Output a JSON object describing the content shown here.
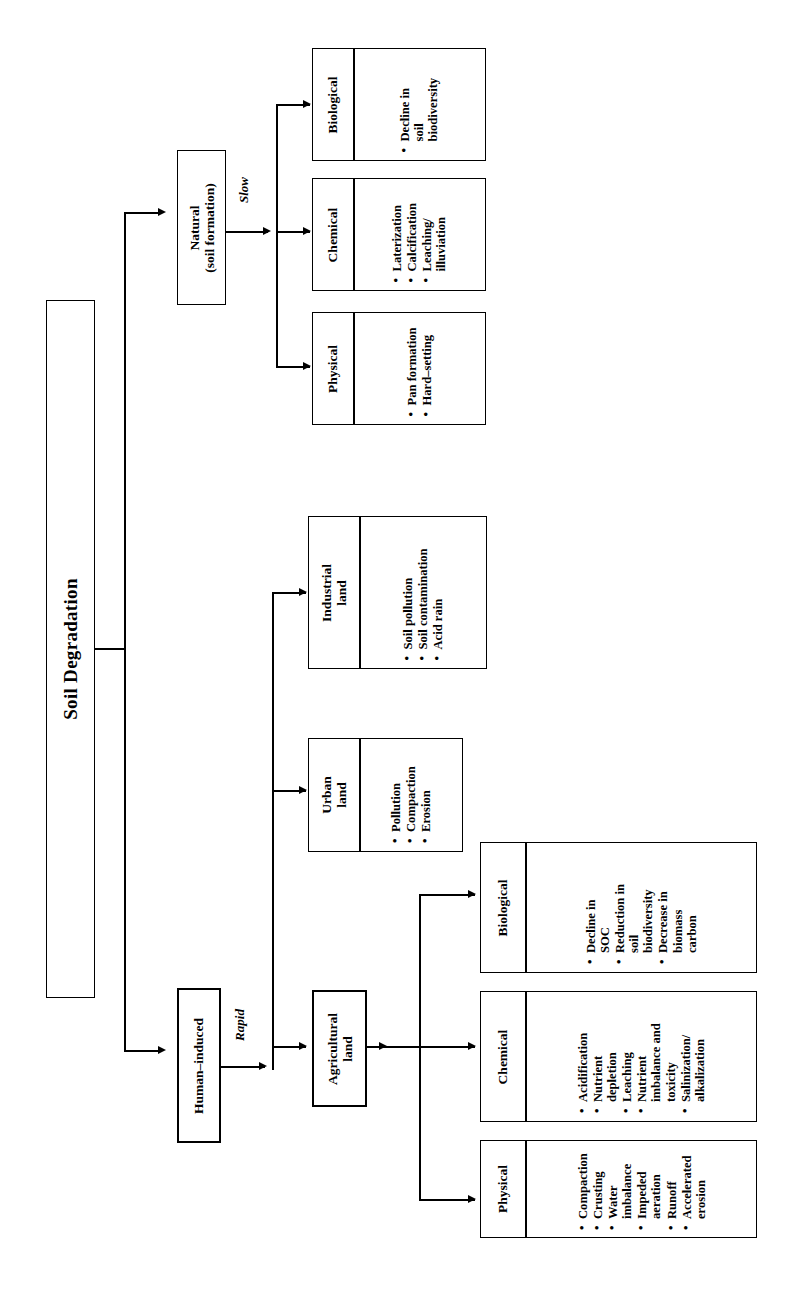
{
  "diagram": {
    "title": "Soil Degradation",
    "orientation": "rotated-90-ccw",
    "root": {
      "label": "Soil Degradation"
    },
    "branches": [
      {
        "id": "natural",
        "label": "Natural\n(soil formation)",
        "label_line1": "Natural",
        "label_line2": "(soil formation)",
        "rate": "Slow",
        "children": [
          {
            "id": "natural-physical",
            "label": "Physical",
            "items": [
              "Pan formation",
              "Hard–setting"
            ]
          },
          {
            "id": "natural-chemical",
            "label": "Chemical",
            "items": [
              "Laterization",
              "Calcification",
              "Leaching/ illuviation"
            ]
          },
          {
            "id": "natural-biological",
            "label": "Biological",
            "items": [
              "Decline in soil biodiversity"
            ]
          }
        ]
      },
      {
        "id": "human-induced",
        "label": "Human–induced",
        "rate": "Rapid",
        "children": [
          {
            "id": "agricultural-land",
            "label_line1": "Agricultural",
            "label_line2": "land",
            "label": "Agricultural land",
            "children": [
              {
                "id": "ag-physical",
                "label": "Physical",
                "items": [
                  "Compaction",
                  "Crusting",
                  "Water imbalance",
                  "Impeded aeration",
                  "Runoff",
                  "Accelerated erosion"
                ]
              },
              {
                "id": "ag-chemical",
                "label": "Chemical",
                "items": [
                  "Acidification",
                  "Nutrient depletion",
                  "Leaching",
                  "Nutrient imbalance and toxicity",
                  "Salinization/ alkalization"
                ]
              },
              {
                "id": "ag-biological",
                "label": "Biological",
                "items": [
                  "Decline in SOC",
                  "Reduction in soil biodiversity",
                  "Decrease in biomass carbon"
                ]
              }
            ]
          },
          {
            "id": "urban-land",
            "label_line1": "Urban",
            "label_line2": "land",
            "label": "Urban land",
            "items": [
              "Pollution",
              "Compaction",
              "Erosion"
            ]
          },
          {
            "id": "industrial-land",
            "label_line1": "Industrial",
            "label_line2": "land",
            "label": "Industrial land",
            "items": [
              "Soil pollution",
              "Soil contamination",
              "Acid rain"
            ]
          }
        ]
      }
    ]
  },
  "labels": {
    "root_title": "Soil Degradation",
    "natural_l1": "Natural",
    "natural_l2": "(soil formation)",
    "slow": "Slow",
    "human_induced": "Human–induced",
    "rapid": "Rapid",
    "nat_physical": "Physical",
    "nat_chemical": "Chemical",
    "nat_biological": "Biological",
    "nat_phys_1": "Pan formation",
    "nat_phys_2": "Hard–setting",
    "nat_chem_1": "Laterization",
    "nat_chem_2": "Calcification",
    "nat_chem_3a": "Leaching/",
    "nat_chem_3b": "illuviation",
    "nat_bio_1a": "Decline in",
    "nat_bio_1b": "soil",
    "nat_bio_1c": "biodiversity",
    "industrial_l1": "Industrial",
    "industrial_l2": "land",
    "ind_1": "Soil pollution",
    "ind_2": "Soil contamination",
    "ind_3": "Acid rain",
    "urban_l1": "Urban",
    "urban_l2": "land",
    "urb_1": "Pollution",
    "urb_2": "Compaction",
    "urb_3": "Erosion",
    "agri_l1": "Agricultural",
    "agri_l2": "land",
    "ag_physical": "Physical",
    "ag_chemical": "Chemical",
    "ag_biological": "Biological",
    "ag_phys_1": "Compaction",
    "ag_phys_2": "Crusting",
    "ag_phys_3a": "Water",
    "ag_phys_3b": "imbalance",
    "ag_phys_4a": "Impeded",
    "ag_phys_4b": "aeration",
    "ag_phys_5": "Runoff",
    "ag_phys_6a": "Accelerated",
    "ag_phys_6b": "erosion",
    "ag_chem_1": "Acidification",
    "ag_chem_2a": "Nutrient",
    "ag_chem_2b": "depletion",
    "ag_chem_3": "Leaching",
    "ag_chem_4a": "Nutrient",
    "ag_chem_4b": "imbalance and",
    "ag_chem_4c": "toxicity",
    "ag_chem_5a": "Salinization/",
    "ag_chem_5b": "alkalization",
    "ag_bio_1a": "Decline in",
    "ag_bio_1b": "SOC",
    "ag_bio_2a": "Reduction in",
    "ag_bio_2b": "soil",
    "ag_bio_2c": "biodiversity",
    "ag_bio_3a": "Decrease in",
    "ag_bio_3b": "biomass",
    "ag_bio_3c": "carbon"
  },
  "colors": {
    "line": "#000000",
    "background": "#ffffff",
    "text": "#000000"
  }
}
